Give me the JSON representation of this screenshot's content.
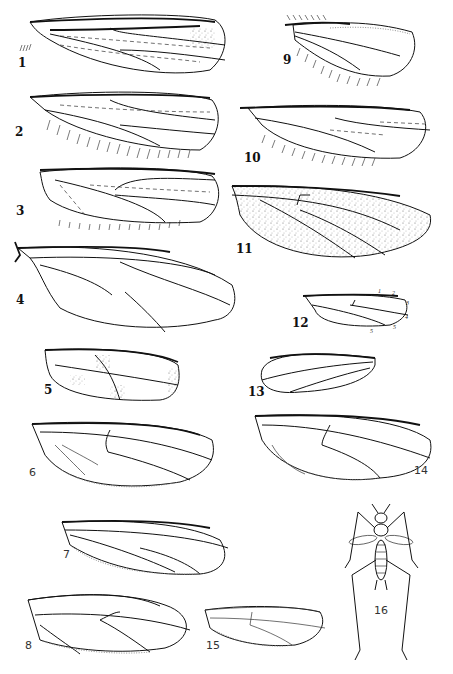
{
  "figure": {
    "figures": [
      {
        "id": 1,
        "label": "1",
        "subject": "wing"
      },
      {
        "id": 2,
        "label": "2",
        "subject": "wing"
      },
      {
        "id": 3,
        "label": "3",
        "subject": "wing"
      },
      {
        "id": 4,
        "label": "4",
        "subject": "wing"
      },
      {
        "id": 5,
        "label": "5",
        "subject": "wing"
      },
      {
        "id": 6,
        "label": "6",
        "subject": "wing"
      },
      {
        "id": 7,
        "label": "7",
        "subject": "wing"
      },
      {
        "id": 8,
        "label": "8",
        "subject": "wing"
      },
      {
        "id": 9,
        "label": "9",
        "subject": "wing"
      },
      {
        "id": 10,
        "label": "10",
        "subject": "wing"
      },
      {
        "id": 11,
        "label": "11",
        "subject": "wing"
      },
      {
        "id": 12,
        "label": "12",
        "subject": "wing",
        "vein_numbers": [
          "1",
          "2",
          "3",
          "4",
          "5",
          "5"
        ]
      },
      {
        "id": 13,
        "label": "13",
        "subject": "wing"
      },
      {
        "id": 14,
        "label": "14",
        "subject": "wing"
      },
      {
        "id": 15,
        "label": "15",
        "subject": "wing"
      },
      {
        "id": 16,
        "label": "16",
        "subject": "whole insect, dorsal view"
      }
    ]
  }
}
